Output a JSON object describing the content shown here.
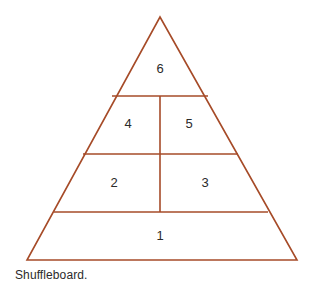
{
  "figure": {
    "caption": "Shuffleboard.",
    "stroke_color": "#a64b28",
    "number_color": "#2a2a2a",
    "background_color": "#ffffff",
    "zones": [
      {
        "label": "6",
        "x": 160,
        "y": 70
      },
      {
        "label": "4",
        "x": 128,
        "y": 125
      },
      {
        "label": "5",
        "x": 189,
        "y": 125
      },
      {
        "label": "2",
        "x": 114,
        "y": 184
      },
      {
        "label": "3",
        "x": 205,
        "y": 184
      },
      {
        "label": "1",
        "x": 160,
        "y": 237
      }
    ],
    "outline": {
      "apex": {
        "x": 160,
        "y": 17
      },
      "base_left": {
        "x": 27,
        "y": 260
      },
      "base_right": {
        "x": 297,
        "y": 260
      }
    },
    "dividers": {
      "horizontal": [
        {
          "y": 96,
          "x1": 112,
          "x2": 208
        },
        {
          "y": 154,
          "x1": 83,
          "x2": 238
        },
        {
          "y": 212,
          "x1": 54,
          "x2": 268
        }
      ],
      "vertical": [
        {
          "x": 160,
          "y1": 96,
          "y2": 212
        }
      ]
    }
  }
}
